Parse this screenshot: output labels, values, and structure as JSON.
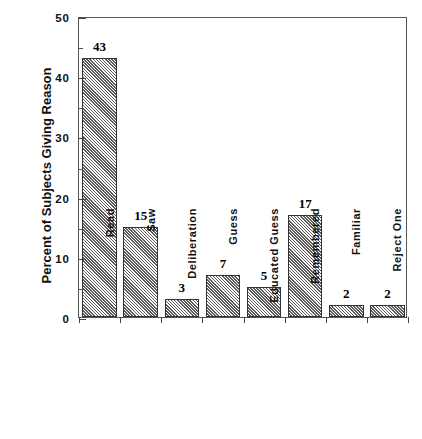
{
  "chart_data": {
    "type": "bar",
    "title": "",
    "subtitle": "",
    "xlabel": "",
    "ylabel": "Percent of Subjects Giving Reason",
    "categories": [
      "Read",
      "Saw",
      "Deliberation",
      "Guess",
      "Educated Guess",
      "Remembered",
      "Familiar",
      "Reject One"
    ],
    "values": [
      43,
      15,
      3,
      7,
      5,
      17,
      2,
      2
    ],
    "value_labels": [
      "43",
      "15",
      "3",
      "7",
      "5",
      "17",
      "2",
      "2"
    ],
    "ylim": [
      0,
      50
    ],
    "y_major_ticks": [
      0,
      10,
      20,
      30,
      40,
      50
    ],
    "y_major_tick_labels": [
      "0",
      "10",
      "20",
      "30",
      "40",
      "50"
    ],
    "y_minor_ticks": [
      5,
      15,
      25,
      35,
      45
    ],
    "grid": false,
    "legend": false,
    "legend_position": "none",
    "bar_fill": "#d2d2d2",
    "bar_hatch": "diagonal",
    "bar_edge_color": "#333333",
    "frame_color": "#555555",
    "text_color": "#111111",
    "background": "#ffffff"
  }
}
